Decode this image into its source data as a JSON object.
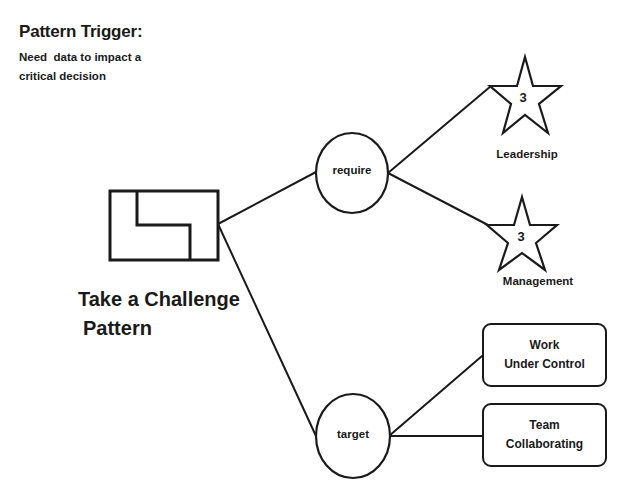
{
  "trigger": {
    "title": "Pattern Trigger:",
    "description_line1": "Need  data to impact a",
    "description_line2": "critical decision"
  },
  "pattern": {
    "icon": "pattern-shape-icon",
    "name_line1": "Take a Challenge",
    "name_line2": "Pattern"
  },
  "nodes": {
    "require": {
      "label": "require"
    },
    "target": {
      "label": "target"
    }
  },
  "requirements": [
    {
      "label": "Leadership",
      "level": "3",
      "icon": "star-icon"
    },
    {
      "label": "Management",
      "level": "3",
      "icon": "star-icon"
    }
  ],
  "targets": [
    {
      "line1": "Work",
      "line2": "Under Control"
    },
    {
      "line1": "Team",
      "line2": "Collaborating"
    }
  ],
  "colors": {
    "stroke": "#1a1a1a",
    "background": "#ffffff"
  }
}
